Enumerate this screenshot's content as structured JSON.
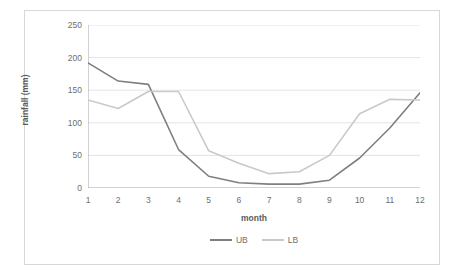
{
  "chart_data": {
    "type": "line",
    "title": "",
    "xlabel": "month",
    "ylabel": "rainfall (mm)",
    "x": [
      1,
      2,
      3,
      4,
      5,
      6,
      7,
      8,
      9,
      10,
      11,
      12
    ],
    "categories": [
      "1",
      "2",
      "3",
      "4",
      "5",
      "6",
      "7",
      "8",
      "9",
      "10",
      "11",
      "12"
    ],
    "xlim": [
      1,
      12
    ],
    "ylim": [
      0,
      250
    ],
    "yticks": [
      0,
      50,
      100,
      150,
      200,
      250
    ],
    "ytick_labels": [
      "0",
      "50",
      "100",
      "150",
      "200",
      "250"
    ],
    "grid": "horizontal",
    "legend_position": "bottom",
    "series": [
      {
        "name": "UB",
        "color": "#7f7f7f",
        "values": [
          192,
          164,
          159,
          59,
          18,
          8,
          6,
          6,
          12,
          46,
          92,
          146
        ]
      },
      {
        "name": "LB",
        "color": "#c9c9c9",
        "values": [
          135,
          122,
          148,
          148,
          57,
          38,
          22,
          25,
          50,
          114,
          136,
          135
        ]
      }
    ]
  },
  "axes": {
    "y_title": "rainfall (mm)",
    "x_title": "month"
  },
  "legend": {
    "entries": [
      {
        "label": "UB",
        "color": "#7f7f7f"
      },
      {
        "label": "LB",
        "color": "#c9c9c9"
      }
    ]
  },
  "colors": {
    "frame": "#d8d8d8",
    "gridline": "#e4e4e4",
    "axis": "#a6a6a6",
    "tick_text": "#6e6e6e",
    "title_text": "#5a5a5a",
    "background": "#ffffff"
  }
}
